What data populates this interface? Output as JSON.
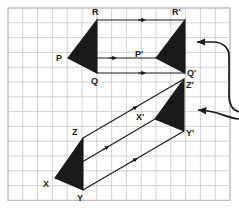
{
  "figure": {
    "background_color": "#ffffff",
    "grid": {
      "line_color": "#c9cdd4",
      "border_color": "#b9bec6",
      "cell_size": 14.8,
      "origin_x": 8,
      "origin_y": 8,
      "cols": 15,
      "rows": 13,
      "visible": true
    },
    "shape_fill": "#1a1a1a",
    "shape_stroke": "#1a1a1a",
    "arrow_color": "#1a1a1a"
  },
  "chart_data": {
    "type": "diagram",
    "shapes": [
      {
        "name": "triangle-pqr",
        "kind": "filled-triangle",
        "vertices": [
          {
            "label": "P",
            "x": 68,
            "y": 58
          },
          {
            "label": "Q",
            "x": 97,
            "y": 73
          },
          {
            "label": "R",
            "x": 97,
            "y": 20
          }
        ]
      },
      {
        "name": "triangle-pqr-image",
        "kind": "filled-triangle",
        "vertices": [
          {
            "label": "P'",
            "x": 156,
            "y": 58
          },
          {
            "label": "Q'",
            "x": 185,
            "y": 73
          },
          {
            "label": "R'",
            "x": 185,
            "y": 20
          }
        ]
      },
      {
        "name": "triangle-xyz",
        "kind": "filled-triangle",
        "vertices": [
          {
            "label": "X",
            "x": 55,
            "y": 178
          },
          {
            "label": "Y",
            "x": 83,
            "y": 190
          },
          {
            "label": "Z",
            "x": 83,
            "y": 138
          }
        ]
      },
      {
        "name": "triangle-xyz-image",
        "kind": "filled-triangle",
        "vertices": [
          {
            "label": "X'",
            "x": 155,
            "y": 119
          },
          {
            "label": "Y'",
            "x": 184,
            "y": 131
          },
          {
            "label": "Z'",
            "x": 184,
            "y": 79
          }
        ]
      }
    ],
    "translation_vectors": [
      {
        "name": "vector-p-to-p-prime",
        "from": [
          68,
          58
        ],
        "to": [
          156,
          58
        ]
      },
      {
        "name": "vector-q-to-q-prime",
        "from": [
          97,
          73
        ],
        "to": [
          185,
          73
        ]
      },
      {
        "name": "vector-r-to-r-prime",
        "from": [
          97,
          20
        ],
        "to": [
          185,
          20
        ]
      },
      {
        "name": "vector-x-to-x-prime",
        "from": [
          55,
          178
        ],
        "to": [
          155,
          119
        ]
      },
      {
        "name": "vector-y-to-y-prime",
        "from": [
          83,
          190
        ],
        "to": [
          184,
          131
        ]
      },
      {
        "name": "vector-z-to-z-prime",
        "from": [
          83,
          138
        ],
        "to": [
          184,
          79
        ]
      }
    ],
    "callout_arrows": [
      {
        "name": "callout-arrow-top",
        "points_to": "upper-translation",
        "direction": "left"
      },
      {
        "name": "callout-arrow-bottom",
        "points_to": "lower-translation",
        "direction": "left"
      }
    ]
  },
  "labels": {
    "P": "P",
    "Q": "Q",
    "R": "R",
    "P_prime": "P'",
    "Q_prime": "Q'",
    "R_prime": "R'",
    "X": "X",
    "Y": "Y",
    "Z": "Z",
    "X_prime": "X'",
    "Y_prime": "Y'",
    "Z_prime": "Z'"
  },
  "label_positions": {
    "P": {
      "left": 56,
      "top": 54
    },
    "Q": {
      "left": 91,
      "top": 77
    },
    "R": {
      "left": 92,
      "top": 8
    },
    "P_prime": {
      "left": 135,
      "top": 50
    },
    "Q_prime": {
      "left": 187,
      "top": 69
    },
    "R_prime": {
      "left": 172,
      "top": 8
    },
    "X": {
      "left": 43,
      "top": 180
    },
    "Y": {
      "left": 77,
      "top": 194
    },
    "Z": {
      "left": 72,
      "top": 128
    },
    "X_prime": {
      "left": 136,
      "top": 113
    },
    "Y_prime": {
      "left": 186,
      "top": 129
    },
    "Z_prime": {
      "left": 186,
      "top": 81
    }
  }
}
